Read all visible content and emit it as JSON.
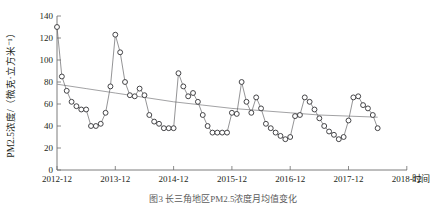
{
  "figure": {
    "caption": "图3  长三角地区PM2.5浓度月均值变化",
    "ylabel": "PM2.5浓度/（微克·立方米⁻¹）",
    "xlabel": "时间",
    "colors": {
      "marker_edge": "#3b3b3e",
      "series_line": "#59595c",
      "trend_line": "#8a8a8d",
      "axis": "#6e6e6e"
    }
  },
  "chart_data": {
    "type": "line",
    "title": "",
    "xlabel": "时间",
    "ylabel": "PM2.5浓度/（微克·立方米⁻¹）",
    "ylim": [
      0,
      140
    ],
    "yticks": [
      0,
      20,
      40,
      60,
      80,
      100,
      120,
      140
    ],
    "xticks": [
      "2012-12",
      "2013-12",
      "2014-12",
      "2015-12",
      "2016-12",
      "2017-12",
      "2018-12"
    ],
    "xlim": [
      "2012-12",
      "2018-12"
    ],
    "grid": false,
    "legend": "none",
    "series": [
      {
        "name": "PM2.5月均浓度",
        "marker": "open-circle",
        "x": [
          "2012-12",
          "2013-01",
          "2013-02",
          "2013-03",
          "2013-04",
          "2013-05",
          "2013-06",
          "2013-07",
          "2013-08",
          "2013-09",
          "2013-10",
          "2013-11",
          "2013-12",
          "2014-01",
          "2014-02",
          "2014-03",
          "2014-04",
          "2014-05",
          "2014-06",
          "2014-07",
          "2014-08",
          "2014-09",
          "2014-10",
          "2014-11",
          "2014-12",
          "2015-01",
          "2015-02",
          "2015-03",
          "2015-04",
          "2015-05",
          "2015-06",
          "2015-07",
          "2015-08",
          "2015-09",
          "2015-10",
          "2015-11",
          "2015-12",
          "2016-01",
          "2016-02",
          "2016-03",
          "2016-04",
          "2016-05",
          "2016-06",
          "2016-07",
          "2016-08",
          "2016-09",
          "2016-10",
          "2016-11",
          "2016-12",
          "2017-01",
          "2017-02",
          "2017-03",
          "2017-04",
          "2017-05",
          "2017-06",
          "2017-07",
          "2017-08",
          "2017-09",
          "2017-10",
          "2017-11",
          "2017-12",
          "2018-01",
          "2018-02",
          "2018-03",
          "2018-04",
          "2018-05",
          "2018-06"
        ],
        "values": [
          130,
          85,
          72,
          62,
          58,
          55,
          55,
          40,
          40,
          42,
          52,
          76,
          123,
          107,
          80,
          68,
          67,
          74,
          68,
          50,
          44,
          42,
          38,
          38,
          38,
          88,
          76,
          67,
          70,
          62,
          50,
          40,
          34,
          34,
          34,
          34,
          52,
          51,
          80,
          62,
          52,
          66,
          56,
          42,
          38,
          34,
          31,
          28,
          30,
          49,
          50,
          66,
          62,
          55,
          47,
          40,
          35,
          32,
          28,
          30,
          45,
          66,
          67,
          59,
          56,
          50,
          38
        ]
      },
      {
        "name": "趋势线",
        "type": "trend",
        "marker": "none",
        "x_endpoints": [
          "2012-12",
          "2018-06"
        ],
        "values_endpoints": [
          78,
          48
        ],
        "values_sampled": [
          78,
          74,
          70,
          66,
          62,
          59,
          56,
          54,
          52,
          50,
          49,
          48
        ]
      }
    ]
  }
}
